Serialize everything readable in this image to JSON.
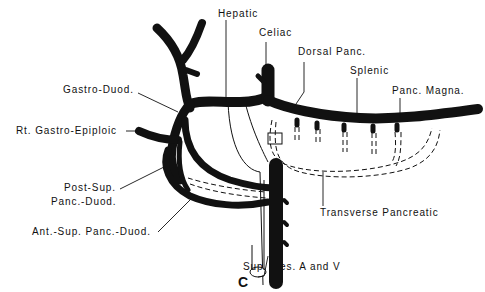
{
  "figure": {
    "panel_letter": "C",
    "colors": {
      "vessel": "#111111",
      "background": "#ffffff"
    }
  },
  "labels": {
    "hepatic": "Hepatic",
    "celiac": "Celiac",
    "dorsal_panc": "Dorsal Panc.",
    "splenic": "Splenic",
    "panc_magna": "Panc. Magna.",
    "gastro_duod": "Gastro-Duod.",
    "rt_gastro_epiploic": "Rt. Gastro-Epiploic",
    "post_sup_line1": "Post-Sup.",
    "post_sup_line2": "Panc.-Duod.",
    "ant_sup_panc_duod": "Ant.-Sup. Panc.-Duod.",
    "transverse_pancreatic": "Transverse Pancreatic",
    "sup_mes": "Sup. Mes. A and V"
  }
}
